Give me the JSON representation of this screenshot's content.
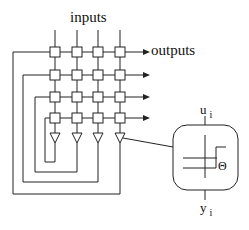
{
  "labels": {
    "inputs": "inputs",
    "outputs": "outputs",
    "u": "u",
    "u_sub": "i",
    "y": "y",
    "y_sub": "i",
    "theta": "Θ"
  },
  "grid": {
    "cols": 4,
    "rows": 4,
    "col_x": [
      55,
      77,
      98,
      120
    ],
    "row_y": [
      52,
      75,
      97,
      118
    ],
    "box_size": 10
  },
  "neuron_detail": {
    "shape": "rounded-square",
    "content": "step-threshold-function"
  },
  "colors": {
    "line": "#222222",
    "background": "#ffffff"
  }
}
